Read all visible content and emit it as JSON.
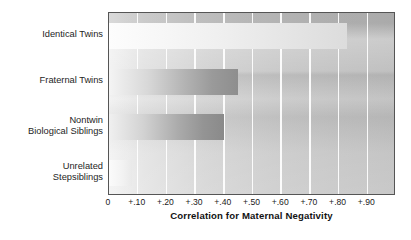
{
  "chart_data": {
    "type": "bar",
    "orientation": "horizontal",
    "title": "",
    "subtitle": "",
    "xlabel": "Correlation for Maternal Negativity",
    "ylabel": "",
    "categories": [
      "Identical Twins",
      "Fraternal Twins",
      "Nontwin\nBiological Siblings",
      "Unrelated\nStepsiblings"
    ],
    "values": [
      0.83,
      0.45,
      0.4,
      0.08
    ],
    "xlim": [
      0,
      1.0
    ],
    "ylim": [
      0,
      4
    ],
    "xticks": [
      0,
      0.1,
      0.2,
      0.3,
      0.4,
      0.5,
      0.6,
      0.7,
      0.8,
      0.9
    ],
    "xticklabels": [
      "0",
      "+.10",
      "+.20",
      "+.30",
      "+.40",
      "+.50",
      "+.60",
      "+.70",
      "+.80",
      "+.90"
    ],
    "grid": true,
    "grid_axis": "x",
    "grid_color": "#ffffff",
    "legend": false,
    "legend_position": "none",
    "plot_background": "#cfcfcf",
    "bar_colors": [
      "#eeeeee",
      "#9a9a9a",
      "#949494",
      "#f2f2f2"
    ],
    "border_color": "#555555",
    "text_color": "#1a1a1a",
    "series": [
      {
        "name": "Correlation for Maternal Negativity",
        "values": [
          0.83,
          0.45,
          0.4,
          0.08
        ]
      }
    ]
  }
}
